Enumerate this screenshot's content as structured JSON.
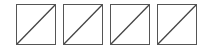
{
  "cells": [
    {
      "icon": "empty-slot-diagonal-icon"
    },
    {
      "icon": "empty-slot-diagonal-icon"
    },
    {
      "icon": "empty-slot-diagonal-icon"
    },
    {
      "icon": "empty-slot-diagonal-icon"
    }
  ],
  "colors": {
    "border": "#555555",
    "line": "#444444",
    "background": "#ffffff"
  }
}
